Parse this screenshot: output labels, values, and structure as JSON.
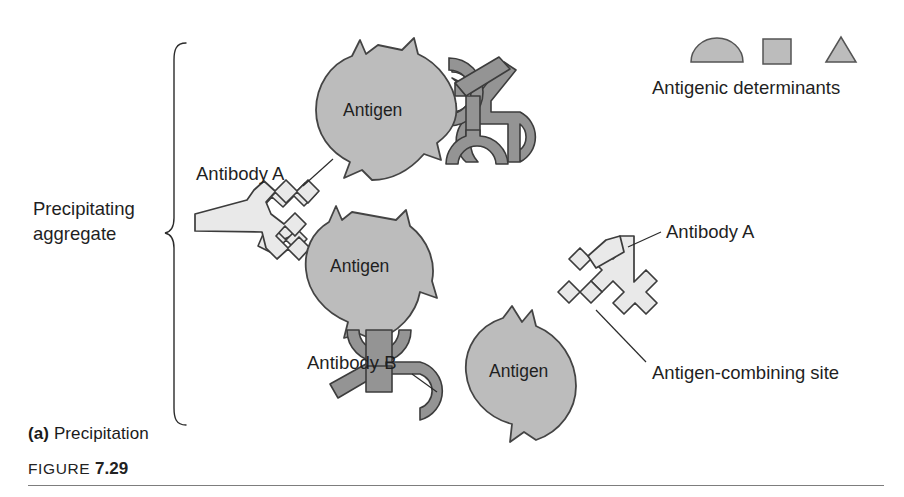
{
  "figure": {
    "panel_letter": "(a)",
    "panel_title": "Precipitation",
    "figure_word": "FIGURE",
    "figure_number": "7.29"
  },
  "legend": {
    "caption": "Antigenic determinants",
    "shapes": [
      {
        "name": "dome-determinant",
        "shape": "semicircle"
      },
      {
        "name": "square-determinant",
        "shape": "square"
      },
      {
        "name": "triangle-determinant",
        "shape": "triangle"
      }
    ]
  },
  "bracket": {
    "label_line1": "Precipitating",
    "label_line2": "aggregate"
  },
  "labels": {
    "antibody_a_left": "Antibody A",
    "antibody_a_right": "Antibody A",
    "antibody_b": "Antibody B",
    "antigen_combining_site": "Antigen-combining site",
    "antigen_top": "Antigen",
    "antigen_middle": "Antigen",
    "antigen_right": "Antigen"
  },
  "colors": {
    "antigen_fill": "#bcbcbc",
    "antibody_a_fill": "#e9e9e9",
    "antibody_b_fill": "#949494",
    "outline": "#3c3c3c",
    "text": "#1f1f1f",
    "rule": "#7d7d7d",
    "background": "#ffffff"
  }
}
